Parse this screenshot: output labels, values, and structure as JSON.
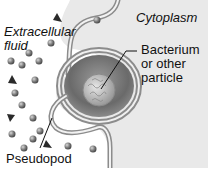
{
  "diagram": {
    "labels": {
      "extracellular_line1": "Extracellular",
      "extracellular_line2": "fluid",
      "cytoplasm": "Cytoplasm",
      "bacterium_line1": "Bacterium",
      "bacterium_line2": "or other",
      "bacterium_line3": "particle",
      "pseudopod": "Pseudopod"
    },
    "colors": {
      "background": "#ffffff",
      "cytoplasm": "#e8e8e8",
      "membrane": "#9a9a9a",
      "vesicle_interior": "#7a7a7a",
      "particle": "#bdbdbd",
      "molecule": "#6e6e6e",
      "text": "#111111"
    },
    "regions": [
      "extracellular fluid",
      "cytoplasm",
      "pseudopod",
      "phagocytic vesicle",
      "bacterium"
    ]
  }
}
